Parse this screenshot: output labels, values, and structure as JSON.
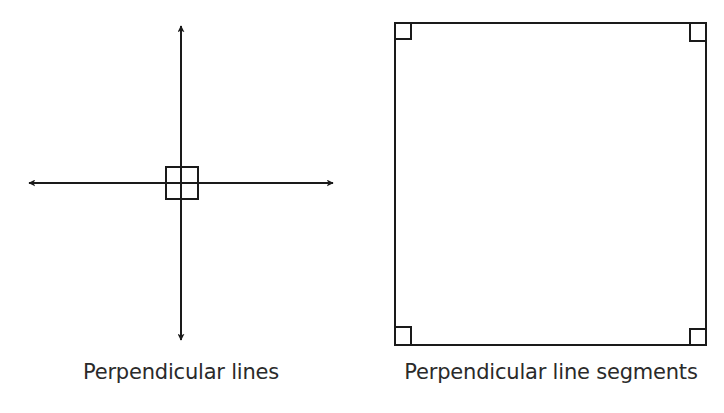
{
  "figures": {
    "left": {
      "caption": "Perpendicular lines",
      "type": "intersecting-lines",
      "vertical_line": {
        "x": 181,
        "y1": 24,
        "y2": 342,
        "arrows": "both"
      },
      "horizontal_line": {
        "y": 183,
        "x1": 27,
        "x2": 335,
        "arrows": "both"
      },
      "right_angle_marker": {
        "x": 166,
        "y": 167,
        "size": 32
      }
    },
    "right": {
      "caption": "Perpendicular line segments",
      "type": "square",
      "square": {
        "x": 395,
        "y": 23,
        "width": 311,
        "height": 322
      },
      "corner_markers": [
        {
          "corner": "top-left"
        },
        {
          "corner": "top-right"
        },
        {
          "corner": "bottom-left"
        },
        {
          "corner": "bottom-right"
        }
      ],
      "corner_marker_size": 16
    }
  },
  "style": {
    "stroke_color": "#1a1a1a",
    "text_color": "#2a2a2a",
    "background": "#ffffff"
  }
}
